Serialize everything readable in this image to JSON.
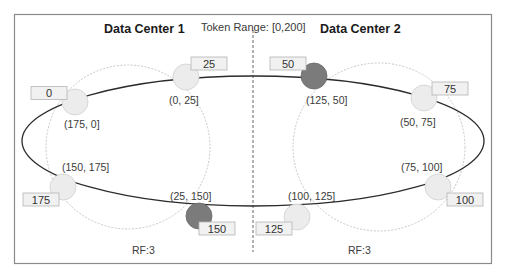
{
  "diagram": {
    "token_range_label": "Token Range: [0,200]",
    "data_centers": [
      {
        "title": "Data Center 1",
        "replication_factor_label": "RF:3",
        "nodes": [
          {
            "token": "0",
            "range": "(175, 0]",
            "highlighted": false
          },
          {
            "token": "25",
            "range": "(0, 25]",
            "highlighted": false
          },
          {
            "token": "150",
            "range": "(25, 150]",
            "highlighted": true
          },
          {
            "token": "175",
            "range": "(150, 175]",
            "highlighted": false
          }
        ]
      },
      {
        "title": "Data Center 2",
        "replication_factor_label": "RF:3",
        "nodes": [
          {
            "token": "50",
            "range": "(125, 50]",
            "highlighted": true
          },
          {
            "token": "75",
            "range": "(50, 75]",
            "highlighted": false
          },
          {
            "token": "100",
            "range": "(75, 100]",
            "highlighted": false
          },
          {
            "token": "125",
            "range": "(100, 125]",
            "highlighted": false
          }
        ]
      }
    ],
    "colors": {
      "frame": "#8a8a8a",
      "ring": "#2b2b2b",
      "node_fill": "#ececec",
      "node_highlight_fill": "#7b7b7b",
      "replica_circle": "#c8c8c8",
      "label_box_fill": "#f1f1f1",
      "label_box_stroke": "#b5b5b5"
    }
  }
}
